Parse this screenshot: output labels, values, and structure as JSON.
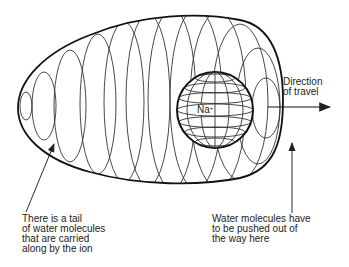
{
  "diagram": {
    "ion": {
      "symbol": "Na",
      "charge": "+"
    },
    "labels": {
      "direction": "Direction\nof travel",
      "tail": "There is a tail\nof water molecules\nthat are carried\nalong by the ion",
      "pushed": "Water molecules have\nto be pushed out of\nthe way here"
    },
    "colors": {
      "line": "#222222",
      "background": "#ffffff"
    }
  }
}
